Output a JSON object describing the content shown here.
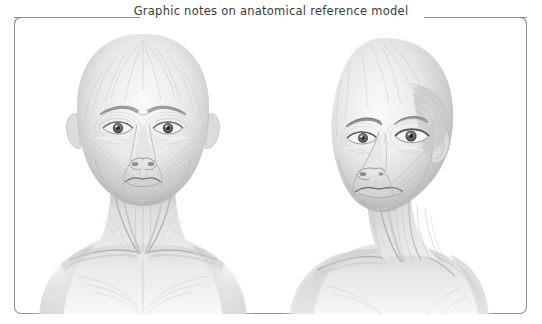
{
  "frame": {
    "title": "Graphic notes on anatomical reference model",
    "border_color": "#8e8e90",
    "background_color": "#ffffff"
  },
  "artwork": {
    "medium": "graphite pencil study, grayscale",
    "subject": "bald female head and shoulders anatomical reference",
    "figures": [
      {
        "name": "frontal-view",
        "label": "anatomical figure front view",
        "orientation": "front",
        "regions": [
          "cranium",
          "frontalis",
          "orbicularis oculi",
          "zygomaticus",
          "masseter",
          "orbicularis oris",
          "platysma",
          "sternocleidomastoid",
          "trapezius",
          "clavicle",
          "pectoralis"
        ]
      },
      {
        "name": "three-quarter-view",
        "label": "anatomical figure three quarter view",
        "orientation": "three-quarter",
        "regions": [
          "cranium",
          "temporalis",
          "orbicularis oculi",
          "masseter",
          "zygomaticus",
          "orbicularis oris",
          "sternocleidomastoid",
          "platysma",
          "trapezius",
          "clavicle",
          "ear"
        ]
      }
    ],
    "tones": {
      "paper": "#ffffff",
      "skin_light": "#f1f1f1",
      "skin_mid": "#d8d8d8",
      "skin_shadow": "#b4b4b4",
      "deep_shadow": "#8d8d8d",
      "line": "#a9a9a9"
    }
  }
}
